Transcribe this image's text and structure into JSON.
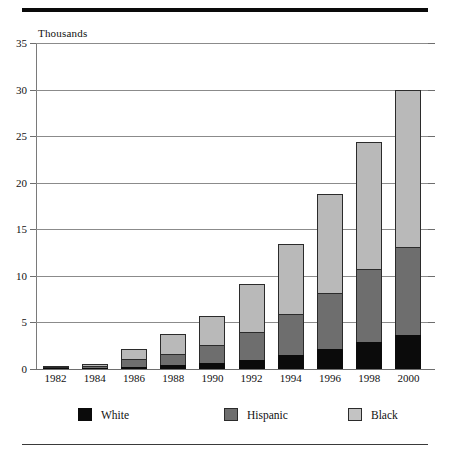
{
  "chart_data": {
    "type": "bar",
    "subtype": "stacked-vertical",
    "title": "",
    "xlabel": "",
    "ylabel": "Thousands",
    "ylim": [
      0,
      35
    ],
    "yticks": [
      0,
      5,
      10,
      15,
      20,
      25,
      30,
      35
    ],
    "grid": true,
    "legend_position": "bottom",
    "categories": [
      "1982",
      "1984",
      "1986",
      "1988",
      "1990",
      "1992",
      "1994",
      "1996",
      "1998",
      "2000"
    ],
    "series": [
      {
        "name": "White",
        "color": "#0b0b0b",
        "values": [
          0.05,
          0.1,
          0.25,
          0.4,
          0.6,
          1.0,
          1.5,
          2.2,
          2.9,
          3.6
        ]
      },
      {
        "name": "Hispanic",
        "color": "#6e6e6e",
        "values": [
          0.03,
          0.25,
          0.85,
          1.25,
          2.0,
          3.0,
          4.4,
          6.0,
          7.8,
          9.5
        ]
      },
      {
        "name": "Black",
        "color": "#b9b9b9",
        "values": [
          0.02,
          0.15,
          1.1,
          2.15,
          3.1,
          5.1,
          7.5,
          10.6,
          13.7,
          16.9
        ]
      }
    ],
    "totals": [
      0.1,
      0.5,
      2.2,
      3.8,
      5.7,
      9.1,
      13.4,
      18.8,
      24.4,
      30.0
    ]
  },
  "legend": {
    "items": [
      {
        "label": "White",
        "swatch": "black-swatch"
      },
      {
        "label": "Hispanic",
        "swatch": "dark-gray-swatch"
      },
      {
        "label": "Black",
        "swatch": "light-gray-swatch"
      }
    ]
  },
  "axis": {
    "caption": "Thousands"
  }
}
